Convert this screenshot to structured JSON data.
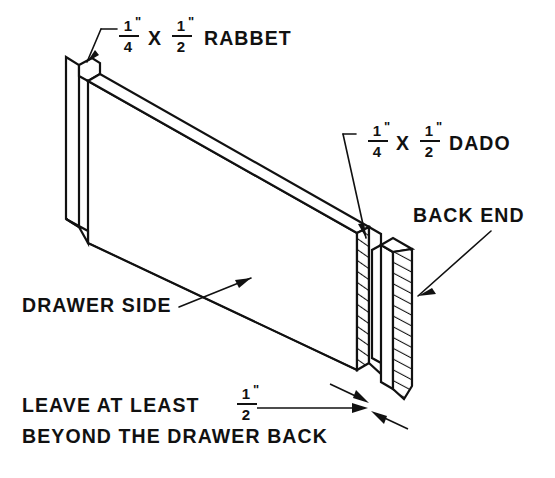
{
  "drawing": {
    "title": "Drawer side joinery detail",
    "background_color": "#ffffff",
    "line_color": "#111111",
    "labels": {
      "rabbet": {
        "fraction_a": {
          "numerator": "1",
          "denominator": "4",
          "unit": "\""
        },
        "separator": "X",
        "fraction_b": {
          "numerator": "1",
          "denominator": "2",
          "unit": "\""
        },
        "name": "RABBET"
      },
      "dado": {
        "fraction_a": {
          "numerator": "1",
          "denominator": "4",
          "unit": "\""
        },
        "separator": "X",
        "fraction_b": {
          "numerator": "1",
          "denominator": "2",
          "unit": "\""
        },
        "name": "DADO"
      },
      "back_end": "BACK END",
      "drawer_side": "DRAWER SIDE",
      "clearance_note": {
        "line1_prefix": "LEAVE AT LEAST",
        "line1_fraction": {
          "numerator": "1",
          "denominator": "2",
          "unit": "\""
        },
        "line2": "BEYOND THE DRAWER BACK"
      }
    },
    "icons": {
      "rabbet_leader": "leader-line-icon",
      "dado_leader": "leader-line-icon",
      "back_end_leader": "arrow-leader-icon",
      "drawer_side_leader": "arrow-leader-icon",
      "clearance_dimension": "dimension-arrow-icon"
    }
  }
}
